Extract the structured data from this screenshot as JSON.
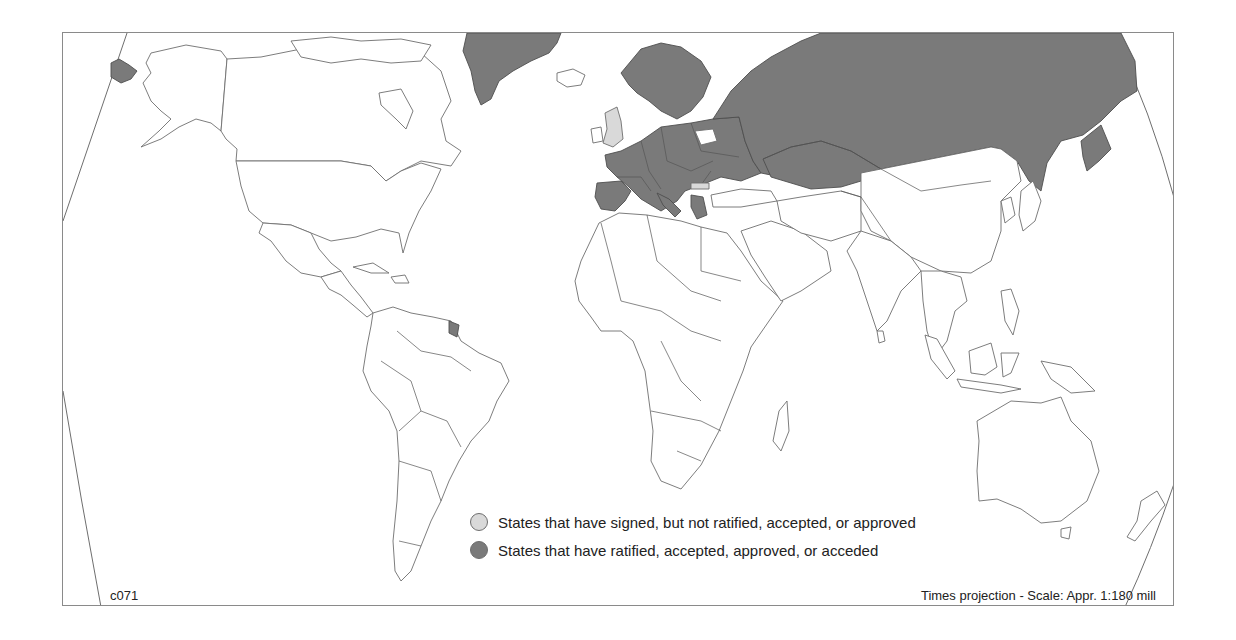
{
  "map": {
    "map_code": "c071",
    "projection_note": "Times projection - Scale: Appr. 1:180 mill",
    "colors": {
      "signed": "#d9d9d9",
      "ratified": "#7a7a7a",
      "other": "#ffffff",
      "outline": "#6e6e6e"
    },
    "legend": [
      {
        "key": "signed",
        "label": "States that have signed, but not ratified, accepted, or approved",
        "color": "#d9d9d9"
      },
      {
        "key": "ratified",
        "label": "States that have ratified, accepted, approved, or acceded",
        "color": "#7a7a7a"
      }
    ],
    "shaded_regions": {
      "ratified": [
        "Russia",
        "Kazakhstan",
        "Greenland (Denmark)",
        "Norway",
        "Sweden",
        "Finland",
        "Estonia",
        "Latvia",
        "Lithuania",
        "Poland",
        "Germany",
        "Netherlands",
        "Belgium",
        "France",
        "Spain",
        "Portugal",
        "Italy",
        "Switzerland",
        "Austria",
        "Czech Republic",
        "Slovakia",
        "Hungary",
        "Slovenia",
        "Croatia",
        "Romania",
        "Moldova",
        "Ukraine",
        "Albania",
        "North Macedonia",
        "Greece",
        "Georgia",
        "Armenia",
        "Azerbaijan",
        "Denmark",
        "Luxembourg",
        "French Guiana (France)",
        "Chukotka (Russia)"
      ],
      "signed": [
        "United Kingdom",
        "Bulgaria"
      ]
    }
  }
}
